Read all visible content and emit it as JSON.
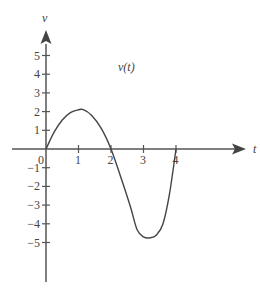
{
  "chart_data": {
    "type": "line",
    "title": "v(t)",
    "xlabel": "t",
    "ylabel": "v",
    "xlim": [
      0,
      5.5
    ],
    "ylim": [
      -6.5,
      6.2
    ],
    "x_ticks": [
      "0",
      "1",
      "2",
      "3",
      "4"
    ],
    "y_ticks": [
      "5",
      "4",
      "3",
      "2",
      "1",
      "-1",
      "-2",
      "-3",
      "-4",
      "-5"
    ],
    "grid": false,
    "legend": null,
    "series": [
      {
        "name": "v(t)",
        "x": [
          0,
          0.25,
          0.5,
          0.75,
          1.0,
          1.15,
          1.4,
          1.7,
          2.0,
          2.3,
          2.6,
          2.8,
          3.0,
          3.2,
          3.4,
          3.6,
          3.8,
          4.0
        ],
        "y": [
          0,
          0.9,
          1.55,
          1.95,
          2.1,
          2.1,
          1.8,
          1.1,
          0,
          -1.5,
          -3.1,
          -4.3,
          -4.7,
          -4.75,
          -4.6,
          -4.0,
          -2.4,
          0
        ]
      }
    ]
  },
  "labels": {
    "curve": "v(t)",
    "x_axis": "t",
    "y_axis": "v",
    "origin": "0"
  },
  "colors": {
    "axis": "#555555",
    "curve": "#444444",
    "text": "#444444"
  }
}
